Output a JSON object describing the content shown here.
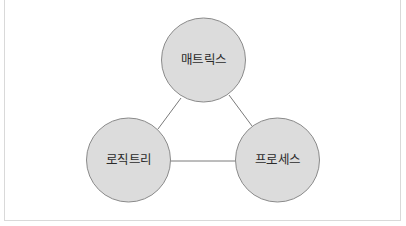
{
  "diagram": {
    "type": "triangle-node-graph",
    "colors": {
      "node_fill": "#dcdcdc",
      "node_stroke": "#8a8a8a",
      "edge": "#7a7a7a",
      "frame": "#d9d9d9",
      "text": "#2b2b2b"
    },
    "nodes": [
      {
        "id": "matrix",
        "label": "매트릭스",
        "cx": 203.5,
        "cy": 60,
        "r": 42
      },
      {
        "id": "logic-tree",
        "label": "로직트리",
        "cx": 128.5,
        "cy": 160,
        "r": 42
      },
      {
        "id": "process",
        "label": "프로세스",
        "cx": 277.5,
        "cy": 160,
        "r": 42
      }
    ],
    "edges": [
      {
        "from": "matrix",
        "to": "logic-tree"
      },
      {
        "from": "matrix",
        "to": "process"
      },
      {
        "from": "logic-tree",
        "to": "process"
      }
    ]
  }
}
